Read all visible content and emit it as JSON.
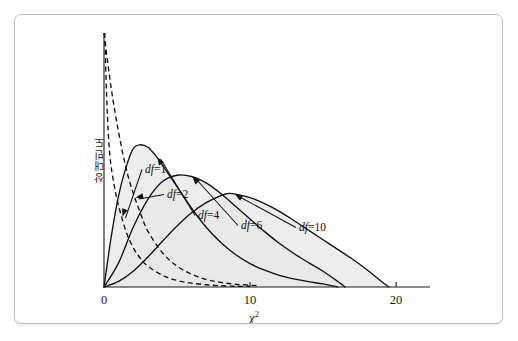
{
  "figure": {
    "border_color": "#bfbfbf",
    "background": "#ffffff"
  },
  "chart_data": {
    "type": "line",
    "title": "",
    "subtitle": "",
    "xlabel": "χ²",
    "xlabel_base": "χ",
    "xlabel_exponent": "2",
    "ylabel": "상대빈도",
    "xlim": [
      0,
      21.5
    ],
    "ylim": [
      0,
      1.0
    ],
    "xticks": [
      0,
      10,
      20
    ],
    "xticklabels": [
      "0",
      "10",
      "20"
    ],
    "yticks": [],
    "yticklabels": [],
    "grid": false,
    "legend_position": "inline-annotations",
    "fill_color": "#e8e8e8",
    "line_color": "#111111",
    "series": [
      {
        "name": "df =1",
        "label_df": "df",
        "label_value": "=1",
        "style": "dashed",
        "filled": false,
        "df": 1,
        "peak_x": 0,
        "description": "monotonically decreasing from top of axis, asymptotic to x-axis near x=10",
        "x": [
          0.05,
          0.2,
          0.4,
          0.7,
          1.0,
          1.5,
          2.0,
          2.5,
          3.0,
          4.0,
          5.0,
          6.0,
          7.0,
          8.0,
          9.0,
          10.0
        ],
        "y": [
          1.0,
          0.72,
          0.52,
          0.4,
          0.32,
          0.22,
          0.155,
          0.112,
          0.082,
          0.046,
          0.026,
          0.015,
          0.009,
          0.005,
          0.003,
          0.002
        ]
      },
      {
        "name": "df =2",
        "label_df": "df",
        "label_value": "=2",
        "style": "dashed",
        "filled": false,
        "df": 2,
        "peak_x": 0,
        "description": "exponential decay from top of axis, asymptotic near x=10.5",
        "x": [
          0.0,
          0.5,
          1.0,
          1.5,
          2.0,
          2.5,
          3.0,
          4.0,
          5.0,
          6.0,
          7.0,
          8.0,
          9.0,
          10.0,
          10.5
        ],
        "y": [
          1.0,
          0.78,
          0.61,
          0.47,
          0.37,
          0.29,
          0.22,
          0.135,
          0.082,
          0.05,
          0.03,
          0.018,
          0.011,
          0.007,
          0.005
        ]
      },
      {
        "name": "df =4",
        "label_df": "df",
        "label_value": "=4",
        "style": "solid",
        "filled": true,
        "df": 4,
        "peak_x": 2.5,
        "peak_y": 0.56,
        "description": "unimodal peak near x=2.5, tail to x=16",
        "x": [
          0.0,
          0.5,
          1.0,
          1.5,
          2.0,
          2.5,
          3.0,
          3.5,
          4.0,
          5.0,
          6.0,
          7.0,
          8.0,
          9.0,
          10.0,
          11.0,
          12.0,
          13.0,
          14.0,
          15.0,
          16.0
        ],
        "y": [
          0.0,
          0.2,
          0.36,
          0.47,
          0.545,
          0.56,
          0.55,
          0.52,
          0.48,
          0.395,
          0.31,
          0.235,
          0.175,
          0.128,
          0.092,
          0.066,
          0.046,
          0.032,
          0.021,
          0.012,
          0.0
        ]
      },
      {
        "name": "df =6",
        "label_df": "df",
        "label_value": "=6",
        "style": "solid",
        "filled": true,
        "df": 6,
        "peak_x": 5.0,
        "peak_y": 0.44,
        "description": "unimodal peak near x=5, tail to x=16.5",
        "x": [
          0.0,
          1.0,
          2.0,
          3.0,
          4.0,
          5.0,
          6.0,
          7.0,
          8.0,
          9.0,
          10.0,
          11.0,
          12.0,
          13.0,
          14.0,
          15.0,
          16.0,
          16.5
        ],
        "y": [
          0.0,
          0.095,
          0.235,
          0.345,
          0.415,
          0.44,
          0.435,
          0.41,
          0.368,
          0.318,
          0.268,
          0.218,
          0.172,
          0.132,
          0.096,
          0.062,
          0.022,
          0.0
        ]
      },
      {
        "name": "df =10",
        "label_df": "df",
        "label_value": "=10",
        "style": "solid",
        "filled": true,
        "df": 10,
        "peak_x": 8.5,
        "peak_y": 0.37,
        "description": "broad unimodal peak near x=8.5, long tail to x=19.5",
        "x": [
          0.0,
          1.0,
          2.0,
          3.0,
          4.0,
          5.0,
          6.0,
          7.0,
          8.0,
          8.5,
          9.0,
          10.0,
          11.0,
          12.0,
          13.0,
          14.0,
          15.0,
          16.0,
          17.0,
          18.0,
          19.0,
          19.5
        ],
        "y": [
          0.0,
          0.022,
          0.062,
          0.118,
          0.18,
          0.24,
          0.292,
          0.332,
          0.36,
          0.368,
          0.366,
          0.352,
          0.328,
          0.298,
          0.262,
          0.224,
          0.186,
          0.148,
          0.11,
          0.068,
          0.022,
          0.0
        ]
      }
    ],
    "annotations": [
      {
        "text": "df =1",
        "series": "df =1",
        "label_x": 130,
        "label_y": 158
      },
      {
        "text": "df =2",
        "series": "df =2",
        "label_x": 152,
        "label_y": 183
      },
      {
        "text": "df =4",
        "series": "df =4",
        "label_x": 183,
        "label_y": 204
      },
      {
        "text": "df =6",
        "series": "df =6",
        "label_x": 226,
        "label_y": 214
      },
      {
        "text": "df =10",
        "series": "df =10",
        "label_x": 284,
        "label_y": 216
      }
    ]
  }
}
